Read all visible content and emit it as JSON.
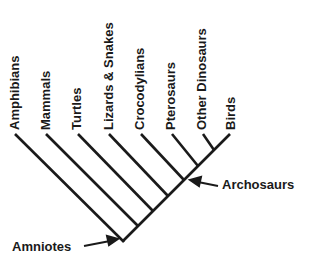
{
  "diagram": {
    "type": "cladogram",
    "line_color": "#1a1a1a",
    "taxa": [
      {
        "label": "Amphibians",
        "tip_x": 15,
        "tip_y": 135
      },
      {
        "label": "Mammals",
        "tip_x": 46,
        "tip_y": 135
      },
      {
        "label": "Turtles",
        "tip_x": 78,
        "tip_y": 135
      },
      {
        "label": "Lizards & Snakes",
        "tip_x": 109,
        "tip_y": 135
      },
      {
        "label": "Crocodylians",
        "tip_x": 141,
        "tip_y": 135
      },
      {
        "label": "Pterosaurs",
        "tip_x": 172,
        "tip_y": 135
      },
      {
        "label": "Other Dinosaurs",
        "tip_x": 203,
        "tip_y": 135
      },
      {
        "label": "Birds",
        "tip_x": 230,
        "tip_y": 135
      }
    ],
    "nodes": {
      "amniotes": {
        "label": "Amniotes"
      },
      "archosaurs": {
        "label": "Archosaurs"
      }
    }
  }
}
